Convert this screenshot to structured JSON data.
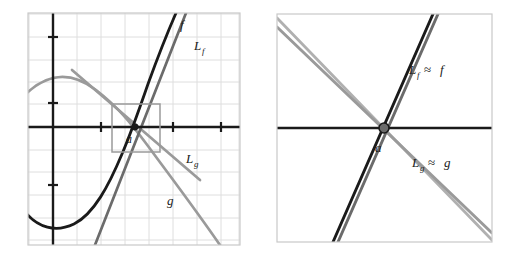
{
  "figure": {
    "panels": [
      {
        "name": "left-panel-zoomed-out",
        "frame": {
          "x": 28,
          "y": 13,
          "width": 212,
          "height": 232,
          "border_color": "#c9c9c9"
        },
        "grid": {
          "spacing": 24,
          "color": "#dedede",
          "visible": true
        },
        "axes": {
          "color": "#1a1a1a",
          "x_axis_y": 127,
          "y_axis_x": 53,
          "x_ticks": [
            101,
            173,
            221
          ],
          "y_ticks": [
            37,
            103,
            185
          ]
        },
        "point_label": "a",
        "point": {
          "x": 135,
          "y": 127
        },
        "inset_box": {
          "x": 112,
          "y": 104,
          "width": 48,
          "height": 48,
          "color": "#9a9a9a"
        },
        "curve_labels": [
          {
            "text": "f",
            "x": 183,
            "y": 28,
            "color": "#1a1a1a"
          },
          {
            "text": "L",
            "sub": "f",
            "x": 198,
            "y": 48,
            "color": "#1a1a1a"
          },
          {
            "text": "L",
            "sub": "g",
            "x": 190,
            "y": 162,
            "color": "#1a1a1a"
          },
          {
            "text": "g",
            "x": 170,
            "y": 202,
            "color": "#1a1a1a"
          }
        ],
        "curves": [
          {
            "name": "f",
            "color": "#1a1a1a",
            "width": 2.6,
            "style": "cubic-like"
          },
          {
            "name": "L_f",
            "color": "#6b6b6b",
            "width": 2.6,
            "style": "tangent-line"
          },
          {
            "name": "g",
            "color": "#9a9a9a",
            "width": 2.6,
            "style": "sine-like"
          },
          {
            "name": "L_g",
            "color": "#9a9a9a",
            "width": 2.6,
            "style": "tangent-line"
          }
        ]
      },
      {
        "name": "right-panel-zoomed-in",
        "frame": {
          "x": 277,
          "y": 14,
          "width": 215,
          "height": 228,
          "border_color": "#c9c9c9"
        },
        "grid": {
          "visible": false
        },
        "axes": {
          "color": "#1a1a1a",
          "x_axis_y": 128
        },
        "point_label": "a",
        "point": {
          "x": 384,
          "y": 128
        },
        "curve_labels": [
          {
            "text": "L",
            "sub": "f",
            "approx": "≈",
            "tail": "f",
            "x": 411,
            "y": 72,
            "color": "#1a1a1a"
          },
          {
            "text": "L",
            "sub": "g",
            "approx": "≈",
            "tail": "g",
            "x": 414,
            "y": 165,
            "color": "#1a1a1a"
          }
        ],
        "curves": [
          {
            "name": "f",
            "color": "#1a1a1a",
            "width": 2.8,
            "style": "near-line"
          },
          {
            "name": "L_f",
            "color": "#6b6b6b",
            "width": 2.8,
            "style": "line"
          },
          {
            "name": "g",
            "color": "#9a9a9a",
            "width": 2.8,
            "style": "near-line"
          },
          {
            "name": "L_g",
            "color": "#b0b0b0",
            "width": 2.8,
            "style": "line"
          }
        ]
      }
    ],
    "colors": {
      "black": "#1a1a1a",
      "dark_gray": "#6b6b6b",
      "mid_gray": "#9a9a9a",
      "light_gray": "#b0b0b0",
      "grid": "#dedede",
      "frame": "#c9c9c9",
      "background": "#ffffff"
    }
  }
}
